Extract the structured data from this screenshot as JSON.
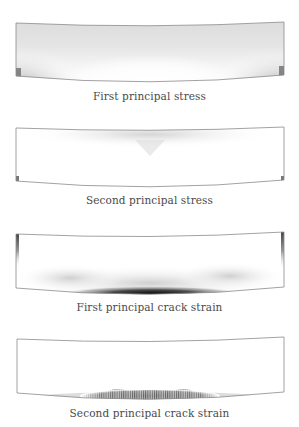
{
  "figure": {
    "panels": [
      {
        "id": "first-principal-stress",
        "caption": "First principal stress"
      },
      {
        "id": "second-principal-stress",
        "caption": "Second principal stress"
      },
      {
        "id": "first-principal-crack-strain",
        "caption": "First principal crack strain"
      },
      {
        "id": "second-principal-crack-strain",
        "caption": "Second principal crack strain"
      }
    ],
    "colors": {
      "outline": "#8a8a8a",
      "contour_dark": "#1a1a1a",
      "contour_light": "#ffffff",
      "caption": "#4a4a4a"
    }
  }
}
